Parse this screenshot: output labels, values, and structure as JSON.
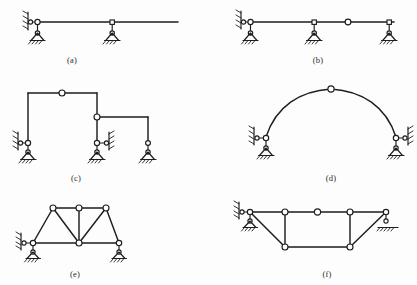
{
  "figure": {
    "title_fragment": "",
    "background_color": "#fdfdfd",
    "line_color": "#1d1d1d",
    "node_fill": "#ffffff",
    "width": 417,
    "height": 285
  },
  "captions": {
    "a": "(a)",
    "b": "(b)",
    "c": "(c)",
    "d": "(d)",
    "e": "(e)",
    "f": "(f)"
  },
  "panels": [
    {
      "id": "a",
      "label": "(a)",
      "type": "horizontal-beam",
      "members": 1,
      "hinges": 1,
      "supports": [
        "link-to-wall",
        "pin-on-ground",
        "pin-on-ground"
      ],
      "notes": "Straight horizontal beam carried by a vertical wall link at the left end, a short vertical post to a ground pin near the left, and a second vertical post to a ground pin at mid-span"
    },
    {
      "id": "b",
      "label": "(b)",
      "type": "continuous-beam",
      "members": 1,
      "hinges": 1,
      "supports": [
        "link-to-wall",
        "pin-on-ground",
        "pin-on-ground",
        "pin-on-ground"
      ],
      "notes": "Continuous horizontal beam with a wall link at the left, three ground supports on short posts and one free internal hinge between the middle and right supports"
    },
    {
      "id": "c",
      "label": "(c)",
      "type": "two-bay-frame",
      "members": 6,
      "hinges": 2,
      "supports": [
        "link-and-pin",
        "link-and-pin",
        "pin-on-ground"
      ],
      "notes": "Stepped two-bay rigid frame: tall left bay with a hinge at the centre of the upper beam, a hinge at the top of the middle column and a lower right bay"
    },
    {
      "id": "d",
      "label": "(d)",
      "type": "three-hinged-arch",
      "members": 2,
      "hinges": 3,
      "supports": [
        "link-and-pin",
        "link-and-pin"
      ],
      "notes": "Symmetric parabolic three-hinged arch with a crown hinge and two inclined springing supports, each on a wall link and a ground pin"
    },
    {
      "id": "e",
      "label": "(e)",
      "type": "truss",
      "members": 9,
      "hinges": 6,
      "supports": [
        "link-and-pin",
        "pin-on-ground"
      ],
      "notes": "Parallel-chord truss: three upper chord joints, three lower chord joints, two inclined end diagonals, one vertical and two inner diagonals meeting at the centre of the lower chord"
    },
    {
      "id": "f",
      "label": "(f)",
      "type": "trapezoidal-truss",
      "members": 9,
      "hinges": 7,
      "supports": [
        "link-and-pin",
        "roller-on-ground"
      ],
      "notes": "Trapezoidal truss with a central hinge in the top chord, two vertical posts, two inclined end diagonals and a shorter lower chord"
    }
  ],
  "legend": {
    "hinge": "open circle joint",
    "ground": "hatched ground line",
    "link": "short bar connected to a hatched wall"
  }
}
